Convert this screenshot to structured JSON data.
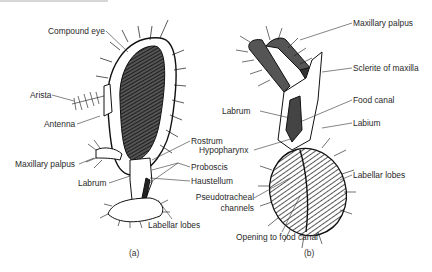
{
  "figure": {
    "panel_a": {
      "caption": "(a)",
      "labels": {
        "compound_eye": "Compound eye",
        "arista": "Arista",
        "antenna": "Antenna",
        "maxillary_palpus": "Maxillary palpus",
        "labrum": "Labrum",
        "rostrum": "Rostrum",
        "proboscis": "Proboscis",
        "haustellum": "Haustellum",
        "labellar_lobes": "Labellar lobes"
      }
    },
    "panel_b": {
      "caption": "(b)",
      "labels": {
        "maxillary_palpus": "Maxillary palpus",
        "sclerite_of_maxilla": "Sclerite of maxilla",
        "labrum": "Labrum",
        "food_canal": "Food canal",
        "labium": "Labium",
        "hypopharynx": "Hypopharynx",
        "labellar_lobes": "Labellar lobes",
        "pseudotracheal_channels_1": "Pseudotracheal",
        "pseudotracheal_channels_2": "channels",
        "opening_to_food_canal": "Opening to food canal"
      }
    }
  }
}
